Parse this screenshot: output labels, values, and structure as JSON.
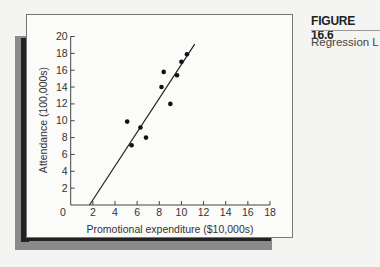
{
  "figure": {
    "label": "FIGURE 16.6",
    "caption": "Regression L"
  },
  "chart_data": {
    "type": "scatter",
    "title": "",
    "xlabel": "Promotional expenditure ($10,000s)",
    "ylabel": "Attendance (100,000s)",
    "xlim": [
      0,
      18
    ],
    "ylim": [
      0,
      20
    ],
    "xticks": [
      2,
      4,
      6,
      8,
      10,
      12,
      14,
      16,
      18
    ],
    "yticks": [
      2,
      4,
      6,
      8,
      10,
      12,
      14,
      16,
      18,
      20
    ],
    "origin_label": "0",
    "grid": false,
    "legend": "none",
    "points": [
      {
        "x": 5.1,
        "y": 9.9
      },
      {
        "x": 5.5,
        "y": 7.1
      },
      {
        "x": 6.3,
        "y": 9.2
      },
      {
        "x": 6.8,
        "y": 8.0
      },
      {
        "x": 8.2,
        "y": 14.0
      },
      {
        "x": 8.4,
        "y": 15.8
      },
      {
        "x": 9.0,
        "y": 12.0
      },
      {
        "x": 9.6,
        "y": 15.4
      },
      {
        "x": 10.0,
        "y": 17.0
      },
      {
        "x": 10.5,
        "y": 17.9
      }
    ],
    "regression_line": {
      "x1": 1.7,
      "y1": 0,
      "x2": 11.2,
      "y2": 19.1
    }
  }
}
